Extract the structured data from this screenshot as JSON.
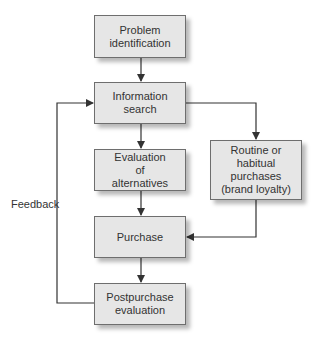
{
  "diagram": {
    "nodes": {
      "problem_identification": "Problem\nidentification",
      "information_search": "Information\nsearch",
      "evaluation_of_alternatives": "Evaluation\nof\nalternatives",
      "routine_purchases": "Routine or\nhabitual\npurchases\n(brand loyalty)",
      "purchase": "Purchase",
      "postpurchase_evaluation": "Postpurchase\nevaluation"
    },
    "feedback_label": "Feedback",
    "edges": [
      {
        "from": "problem_identification",
        "to": "information_search"
      },
      {
        "from": "information_search",
        "to": "evaluation_of_alternatives"
      },
      {
        "from": "information_search",
        "to": "routine_purchases"
      },
      {
        "from": "evaluation_of_alternatives",
        "to": "purchase"
      },
      {
        "from": "routine_purchases",
        "to": "purchase"
      },
      {
        "from": "purchase",
        "to": "postpurchase_evaluation"
      },
      {
        "from": "postpurchase_evaluation",
        "to": "information_search",
        "label": "Feedback"
      }
    ],
    "colors": {
      "box_fill": "#e6e6e6",
      "box_border": "#6e6e6e",
      "line": "#333333",
      "text": "#333333"
    }
  }
}
